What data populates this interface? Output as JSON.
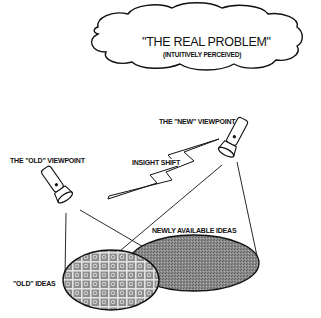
{
  "diagram": {
    "cloud": {
      "title": "\"THE REAL PROBLEM\"",
      "subtitle": "(INTUITIVELY PERCEIVED)"
    },
    "labels": {
      "old_viewpoint": "THE \"OLD\" VIEWPOINT",
      "new_viewpoint": "THE \"NEW\" VIEWPOINT",
      "insight_shift": "INSIGHT SHIFT",
      "newly_available_ideas": "NEWLY AVAILABLE IDEAS",
      "old_ideas": "\"OLD\" IDEAS"
    },
    "elements": {
      "old_flashlight": "flashlight-icon",
      "new_flashlight": "flashlight-icon",
      "insight_arrow": "lightning-arrow",
      "old_ideas_region": "cross-hatched ellipse",
      "new_ideas_region": "gray stippled ellipse"
    },
    "colors": {
      "ink": "#111111",
      "new_ideas_fill": "#8c8c8c",
      "old_ideas_fill": "#9a9a9a",
      "background": "#ffffff"
    }
  }
}
